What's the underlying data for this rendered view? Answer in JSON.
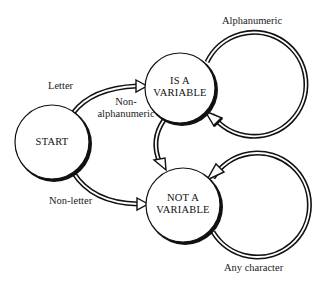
{
  "diagram": {
    "type": "state-machine",
    "nodes": [
      {
        "id": "start",
        "label": "START",
        "lines": [
          "START"
        ]
      },
      {
        "id": "is_variable",
        "label": "IS A VARIABLE",
        "lines": [
          "IS A",
          "VARIABLE"
        ]
      },
      {
        "id": "not_variable",
        "label": "NOT A VARIABLE",
        "lines": [
          "NOT A",
          "VARIABLE"
        ]
      }
    ],
    "edges": [
      {
        "from": "start",
        "to": "is_variable",
        "label": "Letter"
      },
      {
        "from": "start",
        "to": "not_variable",
        "label": "Non-letter"
      },
      {
        "from": "is_variable",
        "to": "not_variable",
        "label": "Non-alphanumeric",
        "lines": [
          "Non-",
          "alphanumeric"
        ]
      },
      {
        "from": "is_variable",
        "to": "is_variable",
        "label": "Alphanumeric"
      },
      {
        "from": "not_variable",
        "to": "not_variable",
        "label": "Any character"
      }
    ]
  }
}
